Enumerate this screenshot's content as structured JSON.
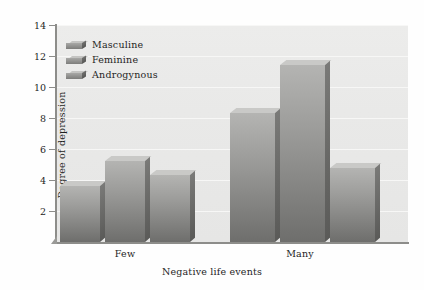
{
  "chart_data": {
    "type": "bar",
    "title": "",
    "xlabel": "Negative life events",
    "ylabel": "Degree of depression",
    "categories": [
      "Few",
      "Many"
    ],
    "series": [
      {
        "name": "Masculine",
        "values": [
          3.6,
          8.3
        ]
      },
      {
        "name": "Feminine",
        "values": [
          5.2,
          11.4
        ]
      },
      {
        "name": "Androgynous",
        "values": [
          4.3,
          4.8
        ]
      }
    ],
    "ylim": [
      0,
      14
    ],
    "yticks": [
      2,
      4,
      6,
      8,
      10,
      12,
      14
    ],
    "ytick_labels": [
      "2",
      "4",
      "6",
      "8",
      "10",
      "12",
      "14"
    ],
    "grid": true,
    "legend_position": "top-left",
    "style": "3d-bars-grayscale"
  },
  "axes": {
    "y_title": "Degree of depression",
    "x_title": "Negative life events",
    "y_ticks": [
      "14",
      "12",
      "10",
      "8",
      "6",
      "4",
      "2"
    ],
    "x_categories": [
      "Few",
      "Many"
    ]
  },
  "legend": {
    "items": [
      {
        "label": "Masculine"
      },
      {
        "label": "Feminine"
      },
      {
        "label": "Androgynous"
      }
    ]
  },
  "bars": [
    {
      "group": "Few",
      "series": "Masculine",
      "value": 3.6
    },
    {
      "group": "Few",
      "series": "Feminine",
      "value": 5.2
    },
    {
      "group": "Few",
      "series": "Androgynous",
      "value": 4.3
    },
    {
      "group": "Many",
      "series": "Masculine",
      "value": 8.3
    },
    {
      "group": "Many",
      "series": "Feminine",
      "value": 11.4
    },
    {
      "group": "Many",
      "series": "Androgynous",
      "value": 4.8
    }
  ],
  "colors": {
    "plot_background": "#eaeae9",
    "gridline": "#f7f7f6",
    "axis": "#8d8d8a",
    "bar_light": "#b4b4b2",
    "bar_dark": "#6e6e6c",
    "text": "#1f1f1e",
    "page_background": "#fefefe"
  }
}
